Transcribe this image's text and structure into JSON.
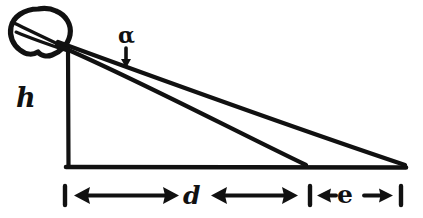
{
  "diagram": {
    "kind": "hand-drawn-geometry-sketch",
    "background_color": "#ffffff",
    "ink_color": "#111111",
    "labels": {
      "height": "h",
      "angle": "α",
      "distance": "d",
      "extra": "e"
    },
    "shapes": {
      "observer_blob": "eye-head-blob",
      "vertical_line": "height-line",
      "baseline": "ground-line",
      "upper_ray": "far-sight-line",
      "lower_ray": "near-sight-line",
      "angle_pointer": "alpha-pointer-tick"
    },
    "dimensions": [
      {
        "name": "d",
        "label": "d",
        "style": "double-arrow",
        "from_tick": true,
        "to_tick": true
      },
      {
        "name": "e",
        "label": "e",
        "style": "double-arrow",
        "from_tick": true,
        "to_tick": true
      }
    ]
  }
}
